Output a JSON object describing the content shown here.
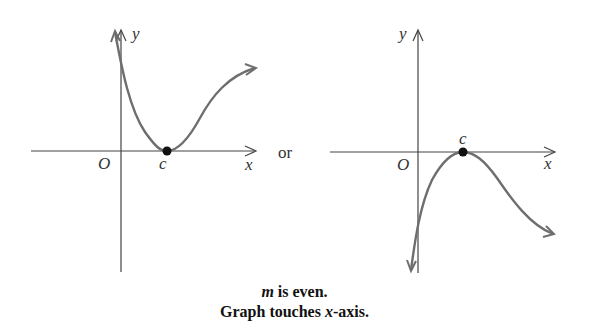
{
  "graphs": [
    {
      "id": "left",
      "y_label": "y",
      "x_label": "x",
      "origin_label": "O",
      "point_label": "c",
      "description": "curve decreases from upper left, touches x-axis at c (local minimum), rises to upper right"
    },
    {
      "id": "right",
      "y_label": "y",
      "x_label": "x",
      "origin_label": "O",
      "point_label": "c",
      "description": "curve rises from lower left, touches x-axis at c (local maximum), falls to lower right"
    }
  ],
  "separator": "or",
  "caption": {
    "line1_var": "m",
    "line1_rest": " is even.",
    "line2_pre": "Graph touches ",
    "line2_var": "x",
    "line2_rest": "-axis."
  },
  "colors": {
    "curve": "#6e6e6e",
    "axis": "#444444",
    "point": "#111111"
  }
}
